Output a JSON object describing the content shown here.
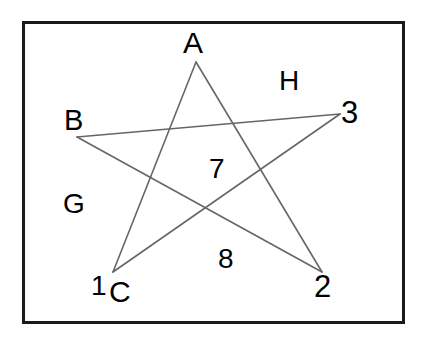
{
  "figure": {
    "type": "pentagram-diagram",
    "canvas": {
      "width": 426,
      "height": 348,
      "background": "#ffffff"
    },
    "frame": {
      "x": 22,
      "y": 21,
      "width": 383,
      "height": 303,
      "stroke": "#1a1a1a",
      "stroke_width": 3,
      "fill": "#ffffff"
    },
    "style": {
      "line_color": "#666666",
      "line_width": 1.6,
      "label_color": "#000000"
    },
    "vertices": [
      {
        "id": "A",
        "label": "A",
        "x": 196,
        "y": 62,
        "role": "top-point"
      },
      {
        "id": "3",
        "label": "3",
        "x": 340,
        "y": 114,
        "role": "right-point"
      },
      {
        "id": "2",
        "label": "2",
        "x": 322,
        "y": 272,
        "role": "bottom-right-point"
      },
      {
        "id": "1",
        "label": "1",
        "x": 113,
        "y": 272,
        "role": "bottom-left-point"
      },
      {
        "id": "B",
        "label": "B",
        "x": 77,
        "y": 137,
        "role": "left-point"
      }
    ],
    "edges": [
      {
        "from": "A",
        "to": "2"
      },
      {
        "from": "2",
        "to": "B"
      },
      {
        "from": "B",
        "to": "3"
      },
      {
        "from": "3",
        "to": "1"
      },
      {
        "from": "1",
        "to": "A"
      }
    ],
    "labels": [
      {
        "name": "label-A",
        "text": "A",
        "x": 196,
        "y": 48,
        "placement": "above-top-vertex"
      },
      {
        "name": "label-B",
        "text": "B",
        "x": 78,
        "y": 124,
        "placement": "above-left-vertex"
      },
      {
        "name": "label-3",
        "text": "3",
        "x": 352,
        "y": 117,
        "placement": "right-of-right-vertex"
      },
      {
        "name": "label-1",
        "text": "1",
        "x": 103,
        "y": 290,
        "placement": "below-left-bottom-vertex"
      },
      {
        "name": "label-C",
        "text": "C",
        "x": 122,
        "y": 296,
        "placement": "below-right-of-1"
      },
      {
        "name": "label-2",
        "text": "2",
        "x": 327,
        "y": 290,
        "placement": "below-bottom-right-vertex"
      },
      {
        "name": "label-7",
        "text": "7",
        "x": 220,
        "y": 172,
        "placement": "interior-upper-center"
      },
      {
        "name": "label-8",
        "text": "8",
        "x": 228,
        "y": 261,
        "placement": "interior-lower-center"
      },
      {
        "name": "label-G",
        "text": "G",
        "x": 75,
        "y": 208,
        "placement": "exterior-left"
      },
      {
        "name": "label-H",
        "text": "H",
        "x": 290,
        "y": 85,
        "placement": "exterior-upper-right"
      }
    ]
  }
}
